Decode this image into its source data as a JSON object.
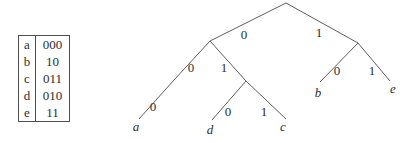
{
  "code_table": {
    "rows": [
      {
        "symbol": "a",
        "code": "000"
      },
      {
        "symbol": "b",
        "code": "10"
      },
      {
        "symbol": "c",
        "code": "011"
      },
      {
        "symbol": "d",
        "code": "010"
      },
      {
        "symbol": "e",
        "code": "11"
      }
    ]
  },
  "tree": {
    "edge_labels": {
      "root_left": "0",
      "root_right": "1",
      "n0_left": "0",
      "n0_right": "1",
      "n00_left": "0",
      "n01_left": "0",
      "n01_right": "1",
      "n1_left": "0",
      "n1_right": "1"
    },
    "leaves": {
      "a": "a",
      "b": "b",
      "c": "c",
      "d": "d",
      "e": "e"
    }
  },
  "colors": {
    "background": "#ffffff",
    "line": "#5e5e5e",
    "text": "#2e2e2e"
  }
}
